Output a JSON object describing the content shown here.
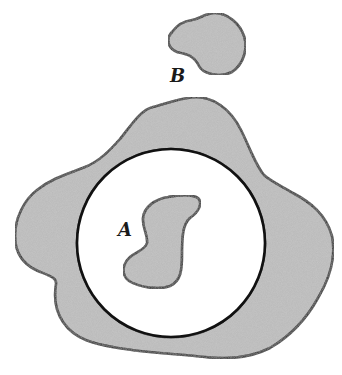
{
  "diagram": {
    "labels": {
      "a": "A",
      "b": "B"
    },
    "colors": {
      "fill": "#b8b8b8",
      "stroke": "#111111",
      "background": "#ffffff",
      "hole": "#ffffff"
    },
    "elements": [
      {
        "id": "region-b",
        "description": "small isolated shaded blob at top",
        "label": "B"
      },
      {
        "id": "outer-region",
        "description": "large irregular shaded region with circular hole"
      },
      {
        "id": "circle-hole",
        "description": "white circular hole inside the outer region"
      },
      {
        "id": "region-a",
        "description": "S-shaped shaded blob inside the circle",
        "label": "A"
      }
    ]
  }
}
